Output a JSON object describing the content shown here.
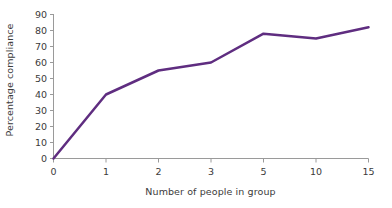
{
  "chart_data": {
    "type": "line",
    "title": "",
    "xlabel": "Number of people in group",
    "ylabel": "Percentage compliance",
    "categories": [
      "0",
      "1",
      "2",
      "3",
      "5",
      "10",
      "15"
    ],
    "values": [
      0,
      40,
      55,
      60,
      78,
      75,
      82
    ],
    "series": [
      {
        "name": "Percentage compliance",
        "values": [
          0,
          40,
          55,
          60,
          78,
          75,
          82
        ],
        "color": "#5f2d80"
      }
    ],
    "x_tick_labels": [
      "0",
      "1",
      "2",
      "3",
      "5",
      "10",
      "15"
    ],
    "y_tick_labels": [
      "0",
      "10",
      "20",
      "30",
      "40",
      "50",
      "60",
      "70",
      "80",
      "90"
    ],
    "y_tick_values": [
      0,
      10,
      20,
      30,
      40,
      50,
      60,
      70,
      80,
      90
    ],
    "ylim": [
      0,
      90
    ],
    "x_scale": "categorical",
    "grid": false,
    "legend": false,
    "legend_position": "none",
    "axis_color": "#9a9a9a",
    "text_color": "#3b3b3b",
    "background_color": "#ffffff",
    "line_color": "#5f2d80",
    "line_width": 2.5,
    "marker": "none"
  }
}
